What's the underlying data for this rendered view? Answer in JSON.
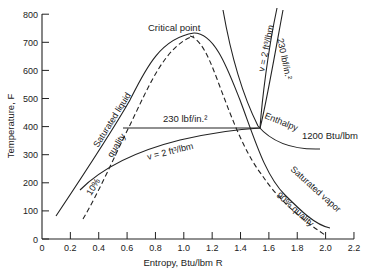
{
  "chart_data": {
    "type": "line",
    "title": "",
    "xlabel": "Entropy, Btu/lbm R",
    "ylabel": "Temperature F",
    "xlim": [
      0,
      2.2
    ],
    "ylim": [
      0,
      800
    ],
    "x_ticks": [
      "0",
      "0.2",
      "0.4",
      "0.6",
      "0.8",
      "1.0",
      "1.2",
      "1.4",
      "1.6",
      "1.8",
      "2.0",
      "2.2"
    ],
    "y_ticks": [
      "0",
      "100",
      "200",
      "300",
      "400",
      "500",
      "600",
      "700",
      "800"
    ],
    "grid": false,
    "annotations": {
      "critical_point": "Critical point",
      "saturated_liquid": "Saturated liquid",
      "saturated_vapor": "Saturated vapor",
      "quality_10": "10%",
      "quality_10_word": "quality",
      "quality_90": "90% quality",
      "pressure_line": "230 lbf/in.²",
      "pressure_line_right": "230 lbf/in.²",
      "volume_line": "v = 2 ft³/lbm",
      "volume_line_right": "v = 2 ft³/lbm",
      "enthalpy_word": "Enthalpy",
      "enthalpy_value": "1200 Btu/lbm"
    },
    "series": [
      {
        "name": "Saturated liquid",
        "x": [
          0.1,
          0.3,
          0.5,
          0.7,
          0.9,
          1.05
        ],
        "y": [
          80,
          200,
          320,
          450,
          610,
          705
        ]
      },
      {
        "name": "Saturated vapor",
        "x": [
          1.05,
          1.2,
          1.4,
          1.55,
          1.7,
          1.9,
          2.05
        ],
        "y": [
          705,
          650,
          480,
          370,
          270,
          175,
          140
        ]
      },
      {
        "name": "10% quality",
        "x": [
          0.3,
          0.5,
          0.7,
          0.9,
          1.05
        ],
        "y": [
          80,
          240,
          410,
          600,
          700
        ]
      },
      {
        "name": "90% quality",
        "x": [
          1.05,
          1.2,
          1.35,
          1.5,
          1.7,
          1.85,
          2.0
        ],
        "y": [
          700,
          620,
          470,
          350,
          240,
          160,
          90
        ]
      },
      {
        "name": "230 lbf/in.² isobar",
        "x": [
          0.7,
          1.56,
          1.6,
          1.7,
          1.85
        ],
        "y": [
          395,
          395,
          430,
          570,
          800
        ]
      },
      {
        "name": "v = 2 ft³/lbm",
        "x": [
          0.5,
          0.7,
          1.0,
          1.3,
          1.56,
          1.62,
          1.75
        ],
        "y": [
          240,
          290,
          345,
          375,
          395,
          480,
          800
        ]
      },
      {
        "name": "Enthalpy 1200 Btu/lbm",
        "x": [
          1.25,
          1.4,
          1.56,
          1.7,
          1.85,
          2.05
        ],
        "y": [
          800,
          560,
          400,
          360,
          330,
          310
        ]
      }
    ]
  },
  "axes": {
    "y_label": "Temperature, F",
    "x_label": "Entropy, Btu/lbm R"
  }
}
